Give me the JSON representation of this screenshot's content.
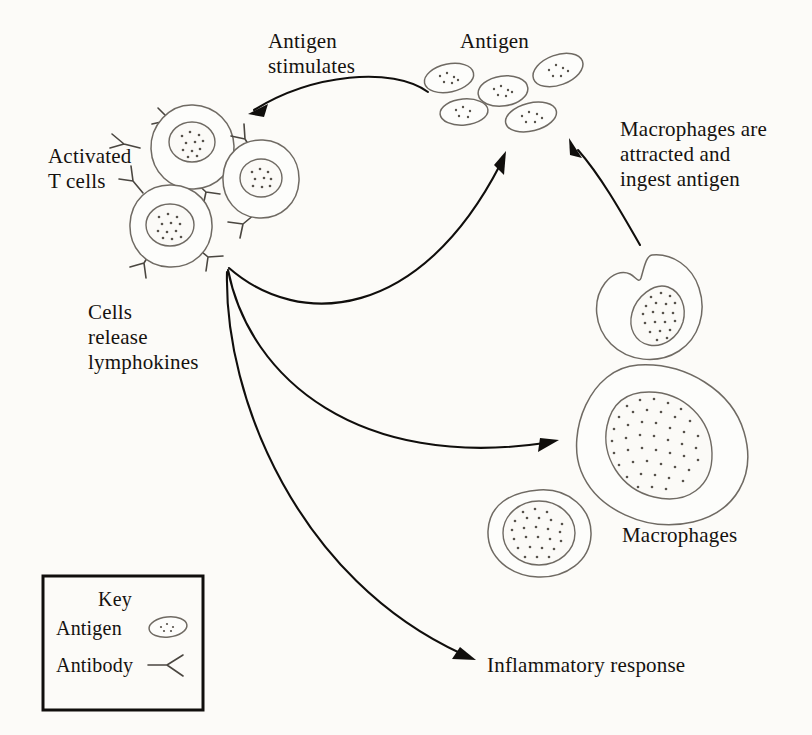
{
  "figure": {
    "background_color": "#fcfbf8",
    "ink_color": "#15120f",
    "outline_color": "#6f6a63"
  },
  "labels": {
    "antigen_stimulates_line1": "Antigen",
    "antigen_stimulates_line2": "stimulates",
    "antigen_pool": "Antigen",
    "macrophages_attracted_line1": "Macrophages are",
    "macrophages_attracted_line2": "attracted and",
    "macrophages_attracted_line3": "ingest antigen",
    "activated_t_cells_line1": "Activated",
    "activated_t_cells_line2": "T cells",
    "cells_release_line1": "Cells",
    "cells_release_line2": "release",
    "cells_release_line3": "lymphokines",
    "macrophages": "Macrophages",
    "inflammatory_response": "Inflammatory response"
  },
  "key": {
    "title": "Key",
    "items": [
      {
        "label": "Antigen",
        "icon": "antigen-oval-icon"
      },
      {
        "label": "Antibody",
        "icon": "antibody-y-icon"
      }
    ]
  },
  "diagram_elements": {
    "antigen_particles": 5,
    "t_cells": 3,
    "macrophages": 3,
    "arrows": [
      {
        "name": "antigen-stimulates-arrow",
        "from": "antigen pool",
        "to": "activated T cells"
      },
      {
        "name": "lymphokines-to-antigen-arrow",
        "from": "T cells",
        "to": "antigen pool"
      },
      {
        "name": "lymphokines-to-macrophage-arrow",
        "from": "T cells",
        "to": "macrophage"
      },
      {
        "name": "lymphokines-to-inflammation-arrow",
        "from": "T cells",
        "to": "inflammatory response"
      },
      {
        "name": "macrophage-ingest-arrow",
        "from": "macrophage",
        "to": "antigen pool"
      }
    ]
  }
}
